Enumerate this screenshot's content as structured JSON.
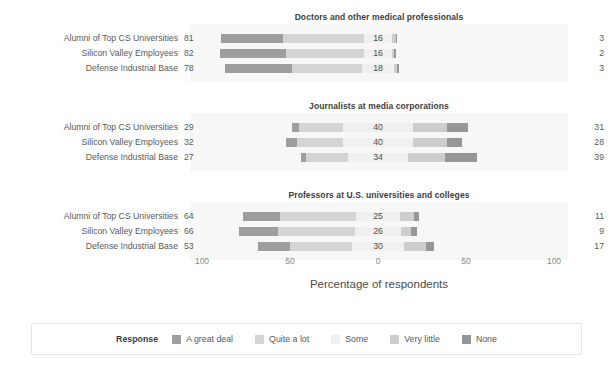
{
  "axis": {
    "title": "Percentage of respondents",
    "ticks": [
      "100",
      "50",
      "0",
      "50",
      "100"
    ],
    "tick_positions": [
      202,
      290,
      378,
      466,
      554
    ],
    "zero_x": 378,
    "px_per_unit": 1.76,
    "range": [
      -100,
      100
    ]
  },
  "legend": {
    "title": "Response",
    "items": [
      {
        "label": "A great deal",
        "color": "#9e9e9e"
      },
      {
        "label": "Quite a lot",
        "color": "#d4d4d4"
      },
      {
        "label": "Some",
        "color": "#f0f0f0"
      },
      {
        "label": "Very little",
        "color": "#cdcdcd"
      },
      {
        "label": "None",
        "color": "#969696"
      }
    ]
  },
  "chart_data": {
    "type": "bar",
    "subtype": "diverging-stacked-bar",
    "title": "",
    "xlabel": "Percentage of respondents",
    "ylabel": "",
    "xlim": [
      -100,
      100
    ],
    "xticks": [
      100,
      50,
      0,
      50,
      100
    ],
    "grid": false,
    "legend_position": "bottom",
    "legend_title": "Response",
    "categories": [
      "Alumni of Top CS Universities",
      "Silicon Valley Employees",
      "Defense Industrial Base"
    ],
    "series": [
      {
        "name": "A great deal",
        "color": "#9e9e9e"
      },
      {
        "name": "Quite a lot",
        "color": "#d4d4d4"
      },
      {
        "name": "Some",
        "color": "#f0f0f0"
      },
      {
        "name": "Very little",
        "color": "#cdcdcd"
      },
      {
        "name": "None",
        "color": "#969696"
      }
    ],
    "panels": [
      {
        "title": "Doctors and other medical professionals",
        "rows": [
          {
            "category": "Alumni of Top CS Universities",
            "left_total": 81,
            "center": 16,
            "right_total": 3,
            "values": {
              "A great deal": 35,
              "Quite a lot": 46,
              "Some": 16,
              "Very little": 2,
              "None": 1
            }
          },
          {
            "category": "Silicon Valley Employees",
            "left_total": 82,
            "center": 16,
            "right_total": 2,
            "values": {
              "A great deal": 38,
              "Quite a lot": 44,
              "Some": 16,
              "Very little": 1,
              "None": 1
            }
          },
          {
            "category": "Defense Industrial Base",
            "left_total": 78,
            "center": 18,
            "right_total": 3,
            "values": {
              "A great deal": 38,
              "Quite a lot": 40,
              "Some": 18,
              "Very little": 2,
              "None": 1
            }
          }
        ]
      },
      {
        "title": "Journalists at media corporations",
        "rows": [
          {
            "category": "Alumni of Top CS Universities",
            "left_total": 29,
            "center": 40,
            "right_total": 31,
            "values": {
              "A great deal": 4,
              "Quite a lot": 25,
              "Some": 40,
              "Very little": 19,
              "None": 12
            }
          },
          {
            "category": "Silicon Valley Employees",
            "left_total": 32,
            "center": 40,
            "right_total": 28,
            "values": {
              "A great deal": 6,
              "Quite a lot": 26,
              "Some": 40,
              "Very little": 19,
              "None": 9
            }
          },
          {
            "category": "Defense Industrial Base",
            "left_total": 27,
            "center": 34,
            "right_total": 39,
            "values": {
              "A great deal": 3,
              "Quite a lot": 24,
              "Some": 34,
              "Very little": 21,
              "None": 18
            }
          }
        ]
      },
      {
        "title": "Professors at U.S. universities and colleges",
        "rows": [
          {
            "category": "Alumni of Top CS Universities",
            "left_total": 64,
            "center": 25,
            "right_total": 11,
            "values": {
              "A great deal": 21,
              "Quite a lot": 43,
              "Some": 25,
              "Very little": 8,
              "None": 3
            }
          },
          {
            "category": "Silicon Valley Employees",
            "left_total": 66,
            "center": 26,
            "right_total": 9,
            "values": {
              "A great deal": 22,
              "Quite a lot": 44,
              "Some": 26,
              "Very little": 6,
              "None": 3
            }
          },
          {
            "category": "Defense Industrial Base",
            "left_total": 53,
            "center": 30,
            "right_total": 17,
            "values": {
              "A great deal": 18,
              "Quite a lot": 35,
              "Some": 30,
              "Very little": 12,
              "None": 5
            }
          }
        ]
      }
    ]
  },
  "layout": {
    "panel_tops": [
      10,
      99,
      188
    ],
    "title_offset": 2,
    "band_offset": 14,
    "band_height": 58,
    "row_offsets": [
      22,
      37,
      52
    ]
  }
}
